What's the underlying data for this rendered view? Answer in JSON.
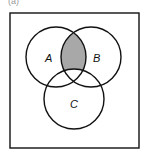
{
  "figure": {
    "tag": "(a)",
    "universe": "rectangle",
    "sets": [
      {
        "label": "A",
        "cx": 56,
        "cy": 57,
        "r": 30
      },
      {
        "label": "B",
        "cx": 91,
        "cy": 57,
        "r": 30
      },
      {
        "label": "C",
        "cx": 74,
        "cy": 99,
        "r": 30
      }
    ],
    "shaded_region": "A ∩ B ∩ C'",
    "shade_color": "#a8a8a8"
  }
}
